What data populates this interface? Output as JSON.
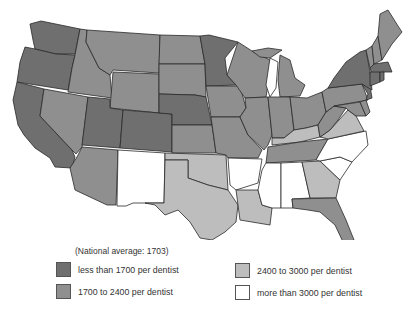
{
  "map": {
    "title": "Population per dentist by state",
    "categories": [
      {
        "id": "c1",
        "label": "less than 1700 per dentist",
        "color": "#6f6f6f"
      },
      {
        "id": "c2",
        "label": "1700 to 2400 per dentist",
        "color": "#8f8f8f"
      },
      {
        "id": "c3",
        "label": "2400 to 3000 per dentist",
        "color": "#bdbdbd"
      },
      {
        "id": "c4",
        "label": "more than 3000 per dentist",
        "color": "#ffffff"
      }
    ],
    "states": {
      "WA": "c1",
      "OR": "c1",
      "CA": "c1",
      "ID": "c2",
      "NV": "c2",
      "MT": "c2",
      "WY": "c2",
      "UT": "c1",
      "CO": "c1",
      "AZ": "c2",
      "NM": "c4",
      "ND": "c2",
      "SD": "c2",
      "NE": "c1",
      "KS": "c2",
      "OK": "c3",
      "TX": "c3",
      "MN": "c1",
      "IA": "c2",
      "MO": "c2",
      "AR": "c4",
      "LA": "c3",
      "WI": "c2",
      "IL": "c2",
      "MI": "c2",
      "IN": "c2",
      "OH": "c2",
      "KY": "c3",
      "TN": "c2",
      "MS": "c4",
      "AL": "c4",
      "GA": "c3",
      "FL": "c2",
      "SC": "c4",
      "NC": "c4",
      "VA": "c3",
      "WV": "c2",
      "PA": "c2",
      "NY": "c1",
      "MD": "c2",
      "DE": "c2",
      "NJ": "c1",
      "CT": "c1",
      "RI": "c1",
      "MA": "c1",
      "VT": "c2",
      "NH": "c2",
      "ME": "c2"
    }
  },
  "legend": {
    "note": "(National average: 1703)",
    "items": [
      {
        "label": "less than 1700 per dentist",
        "color": "#6f6f6f"
      },
      {
        "label": "1700 to 2400 per dentist",
        "color": "#8f8f8f"
      },
      {
        "label": "2400 to 3000 per dentist",
        "color": "#bdbdbd"
      },
      {
        "label": "more than 3000 per dentist",
        "color": "#ffffff"
      }
    ]
  }
}
